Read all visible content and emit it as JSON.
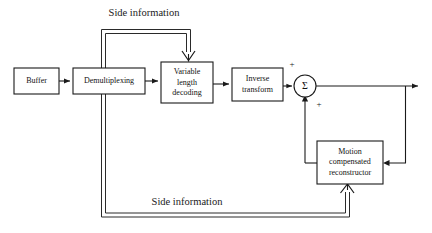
{
  "diagram": {
    "background_color": "#ffffff",
    "line_color": "#1a1a1a",
    "blocks": [
      {
        "id": "buffer",
        "lines": [
          "Buffer"
        ],
        "x": 14,
        "y": 68,
        "w": 45,
        "h": 26
      },
      {
        "id": "demultiplexing",
        "lines": [
          "Demultiplexing"
        ],
        "x": 73,
        "y": 68,
        "w": 72,
        "h": 26
      },
      {
        "id": "variable-length-decoding",
        "lines": [
          "Variable",
          "length",
          "decoding"
        ],
        "x": 161,
        "y": 62,
        "w": 52,
        "h": 41
      },
      {
        "id": "inverse-transform",
        "lines": [
          "Inverse",
          "transform"
        ],
        "x": 232,
        "y": 68,
        "w": 51,
        "h": 33
      },
      {
        "id": "motion-compensated-reconstructor",
        "lines": [
          "Motion",
          "compensated",
          "reconstructor"
        ],
        "x": 317,
        "y": 141,
        "w": 66,
        "h": 43
      }
    ],
    "summing_node": {
      "id": "summing-junction",
      "symbol": "Σ",
      "cx": 305,
      "cy": 86,
      "r": 11
    },
    "signs": [
      {
        "id": "plus-top",
        "text": "+",
        "x": 292,
        "y": 65
      },
      {
        "id": "plus-bottom",
        "text": "+",
        "x": 319,
        "y": 105
      }
    ],
    "labels": [
      {
        "id": "side-information-top",
        "text": "Side information",
        "x": 144,
        "y": 14
      },
      {
        "id": "side-information-bottom",
        "text": "Side information",
        "x": 187,
        "y": 203
      }
    ]
  }
}
